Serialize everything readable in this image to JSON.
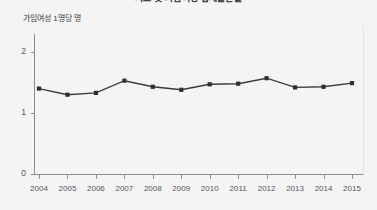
{
  "chart_data": {
    "type": "line",
    "title": "시도 및 가임여성 합계출산율",
    "xlabel": "",
    "ylabel": "가임여성 1명당 명",
    "categories": [
      "2004",
      "2005",
      "2006",
      "2007",
      "2008",
      "2009",
      "2010",
      "2011",
      "2012",
      "2013",
      "2014",
      "2015"
    ],
    "values": [
      1.4,
      1.3,
      1.33,
      1.53,
      1.43,
      1.38,
      1.47,
      1.48,
      1.57,
      1.42,
      1.43,
      1.49
    ],
    "series": [
      {
        "name": "합계출산율",
        "values": [
          1.4,
          1.3,
          1.33,
          1.53,
          1.43,
          1.38,
          1.47,
          1.48,
          1.57,
          1.42,
          1.43,
          1.49
        ]
      }
    ],
    "ylim": [
      0,
      2.35
    ],
    "yticks": [
      0,
      1,
      2
    ],
    "ytick_labels": [
      "0",
      "1",
      "2"
    ],
    "grid": false,
    "legend": false,
    "marker": "square",
    "line_color": "#3a3a42",
    "marker_color": "#2e2e36",
    "background_color": "#f4f4f4",
    "axis_color": "#8c8c94"
  }
}
